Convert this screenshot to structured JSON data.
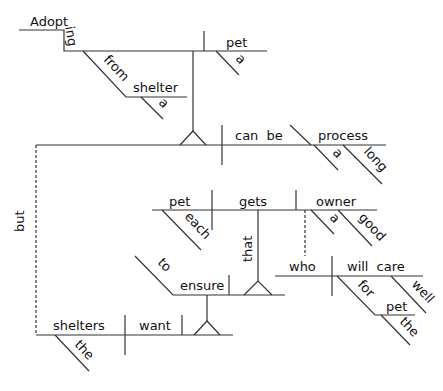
{
  "diagram": {
    "type": "reed-kellogg sentence diagram",
    "sentence_words": {
      "gerund_subject": "Adopting",
      "gerund_object": "pet",
      "gerund_object_article": "a",
      "prep_from": "from",
      "prep_object_shelter": "shelter",
      "shelter_article": "a",
      "verb_can_be": "can be",
      "complement_process": "process",
      "process_article": "a",
      "process_adj": "long",
      "conjunction": "but",
      "subject_shelters": "shelters",
      "shelters_article": "the",
      "verb_want": "want",
      "infinitive_to": "to",
      "infinitive_ensure": "ensure",
      "clause_that": "that",
      "clause_subject_pet": "pet",
      "clause_subject_modifier": "each",
      "clause_verb": "gets",
      "clause_object": "owner",
      "owner_article": "a",
      "owner_adj": "good",
      "rel_subject": "who",
      "rel_verb": "will care",
      "rel_adverb": "well",
      "rel_prep": "for",
      "rel_prep_object": "pet",
      "rel_prep_object_article": "the"
    },
    "line_color": "#333333",
    "text_color": "#111111"
  }
}
